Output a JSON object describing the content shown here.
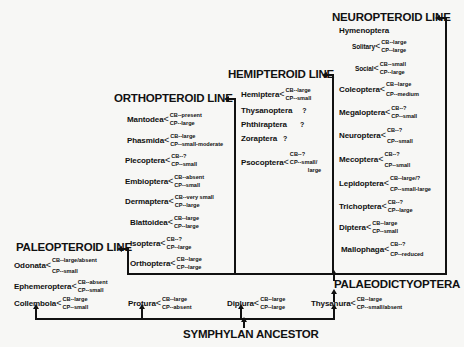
{
  "lines": {
    "paleopteroid": "PALEOPTEROID LINE",
    "orthopteroid": "ORTHOPTEROID LINE",
    "hemipteroid": "HEMIPTEROID LINE",
    "neuropteroid": "NEUROPTEROID LINE",
    "palaeodictyoptera": "PALAEODICTYOPTERA",
    "symphylan": "SYMPHYLAN ANCESTOR"
  },
  "paleopteroid_taxa": [
    {
      "name": "Odonata",
      "cb": "CB--large/absent",
      "cp": "CP--small"
    },
    {
      "name": "Ephemeroptera",
      "cb": "CB--absent",
      "cp": "CP--small"
    }
  ],
  "orthopteroid_taxa": [
    {
      "name": "Mantodea",
      "cb": "CB--present",
      "cp": "CP--large"
    },
    {
      "name": "Phasmida",
      "cb": "CB--large",
      "cp": "CP--small-moderate"
    },
    {
      "name": "Plecoptera",
      "cb": "CB--?",
      "cp": "CP--small"
    },
    {
      "name": "Embioptera",
      "cb": "CB--absent",
      "cp": "CP--small"
    },
    {
      "name": "Dermaptera",
      "cb": "CB--very small",
      "cp": "CP--large"
    },
    {
      "name": "Blattoidea",
      "cb": "CB--large",
      "cp": "CP--large"
    },
    {
      "name": "Isoptera",
      "cb": "CB--?",
      "cp": "CP--large"
    },
    {
      "name": "Orthoptera",
      "cb": "CB--large",
      "cp": "CP--large"
    }
  ],
  "hemipteroid_taxa": [
    {
      "name": "Hemiptera",
      "cb": "CB--large",
      "cp": "CP--small"
    },
    {
      "name": "Thysanoptera",
      "q": "?"
    },
    {
      "name": "Phthiraptera",
      "q": "?"
    },
    {
      "name": "Zoraptera",
      "q": "?"
    },
    {
      "name": "Psocoptera",
      "cb": "CB--?",
      "cp": "CP--small/",
      "cp2": "large"
    }
  ],
  "neuropteroid_taxa": {
    "hymenoptera": "Hymenoptera",
    "solitary": {
      "name": "Solitary",
      "cb": "CB--large",
      "cp": "CP--large"
    },
    "social": {
      "name": "Social",
      "cb": "CB--small",
      "cp": "CP--large"
    },
    "others": [
      {
        "name": "Coleoptera",
        "cb": "CB--large",
        "cp": "CP--medium"
      },
      {
        "name": "Megaloptera",
        "cb": "CB--?",
        "cp": "CP--small"
      },
      {
        "name": "Neuroptera",
        "cb": "CB--?",
        "cp": "CP--small"
      },
      {
        "name": "Mecoptera",
        "cb": "CB--?",
        "cp": "CP--small"
      },
      {
        "name": "Lepidoptera",
        "cb": "CB--large/?",
        "cp": "CP--small-large"
      },
      {
        "name": "Trichoptera",
        "cb": "CB--?",
        "cp": "CP--large"
      },
      {
        "name": "Diptera",
        "cb": "CB--large",
        "cp": "CP--small"
      },
      {
        "name": "Mallophaga",
        "cb": "CB--?",
        "cp": "CP--reduced"
      }
    ]
  },
  "base_taxa": [
    {
      "name": "Collembola",
      "cb": "CB--large",
      "cp": "CP--small"
    },
    {
      "name": "Protura",
      "cb": "CB--large",
      "cp": "CP--absent"
    },
    {
      "name": "Diplura",
      "cb": "CB--large",
      "cp": "CP--large"
    },
    {
      "name": "Thysanura",
      "cb": "CB--large",
      "cp": "CP--small/absent"
    }
  ]
}
